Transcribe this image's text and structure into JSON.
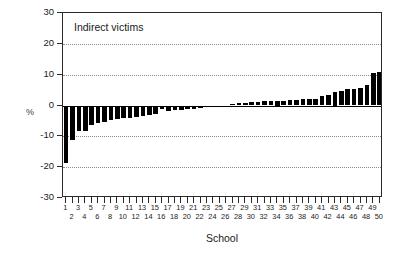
{
  "chart_data": {
    "type": "bar",
    "title": "Indirect victims",
    "xlabel": "School",
    "ylabel": "%",
    "ylim": [
      -30,
      30
    ],
    "yticks": [
      30,
      20,
      10,
      0,
      -10,
      -20,
      -30
    ],
    "ytick_labels": [
      "30",
      "20",
      "10",
      "0",
      "-10",
      "-20",
      "-30"
    ],
    "gridlines_y": [
      20,
      10,
      -10,
      -20
    ],
    "grid": "horizontal-dotted",
    "legend": null,
    "bar_color": "#000000",
    "categories": [
      "1",
      "2",
      "3",
      "4",
      "5",
      "6",
      "7",
      "8",
      "9",
      "10",
      "11",
      "12",
      "13",
      "14",
      "15",
      "16",
      "17",
      "18",
      "19",
      "20",
      "21",
      "22",
      "23",
      "24",
      "25",
      "26",
      "27",
      "28",
      "29",
      "30",
      "31",
      "32",
      "33",
      "34",
      "35",
      "36",
      "37",
      "38",
      "39",
      "40",
      "41",
      "42",
      "43",
      "44",
      "45",
      "46",
      "47",
      "48",
      "49",
      "50"
    ],
    "values": [
      -18.8,
      -11.2,
      -8.4,
      -8.3,
      -6.4,
      -5.6,
      -5.2,
      -4.8,
      -4.4,
      -4.2,
      -3.9,
      -3.6,
      -3.3,
      -3.1,
      -2.9,
      -1.0,
      -1.9,
      -1.6,
      -1.4,
      -1.2,
      -1.0,
      -0.8,
      -0.6,
      -0.4,
      -0.2,
      0.0,
      0.4,
      0.7,
      0.9,
      1.1,
      1.2,
      1.3,
      1.4,
      1.5,
      1.6,
      1.7,
      1.9,
      2.0,
      2.1,
      2.2,
      3.2,
      3.4,
      4.5,
      4.7,
      5.2,
      5.4,
      5.8,
      6.6,
      10.4,
      10.9
    ]
  },
  "axis": {
    "x_tick_count": 50,
    "x_label_rows": 2
  }
}
